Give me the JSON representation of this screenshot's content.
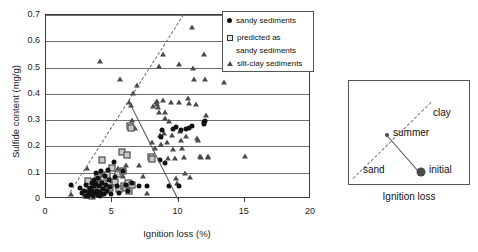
{
  "chart_data": {
    "type": "scatter",
    "title": "",
    "xlabel": "Ignition loss (%)",
    "ylabel": "Sulfide content (mg/g)",
    "xlim": [
      0,
      20
    ],
    "ylim": [
      0,
      0.7
    ],
    "xticks": [
      "0",
      "5",
      "10",
      "15",
      "20"
    ],
    "xtick_values": [
      0,
      5,
      10,
      15,
      20
    ],
    "yticks": [
      "0",
      "0.1",
      "0.2",
      "0.3",
      "0.4",
      "0.5",
      "0.6",
      "0.7"
    ],
    "ytick_values": [
      0,
      0.1,
      0.2,
      0.3,
      0.4,
      0.5,
      0.6,
      0.7
    ],
    "grid": "horizontal",
    "legend_position": "top-right",
    "legend": [
      {
        "marker": "filled-circle",
        "label": "sandy sediments"
      },
      {
        "marker": "open-square",
        "label": "predicted as"
      },
      {
        "marker": "none",
        "label": "sandy sediments"
      },
      {
        "marker": "filled-triangle",
        "label": "silt-clay sediments"
      }
    ],
    "annotations": [
      {
        "type": "dashed-trend-line",
        "x0": 1.8,
        "y0": 0.025,
        "x1": 10.35,
        "y1": 0.7
      },
      {
        "type": "solid-trend-line",
        "x0": 6.3,
        "y0": 0.372,
        "x1": 10.0,
        "y1": 0.0
      }
    ],
    "series": [
      {
        "name": "sandy sediments",
        "marker": "filled-circle",
        "points": [
          [
            1.85,
            0.052
          ],
          [
            2.6,
            0.042
          ],
          [
            2.75,
            0.022
          ],
          [
            2.9,
            0.03
          ],
          [
            3.0,
            0.013
          ],
          [
            3.05,
            0.055
          ],
          [
            3.15,
            0.028
          ],
          [
            3.2,
            0.01
          ],
          [
            3.3,
            0.042
          ],
          [
            3.35,
            0.018
          ],
          [
            3.45,
            0.062
          ],
          [
            3.5,
            0.032
          ],
          [
            3.55,
            0.012
          ],
          [
            3.6,
            0.072
          ],
          [
            3.65,
            0.048
          ],
          [
            3.7,
            0.022
          ],
          [
            3.75,
            0.098
          ],
          [
            3.8,
            0.058
          ],
          [
            3.85,
            0.03
          ],
          [
            3.9,
            0.014
          ],
          [
            3.95,
            0.08
          ],
          [
            4.0,
            0.05
          ],
          [
            4.05,
            0.025
          ],
          [
            4.1,
            0.01
          ],
          [
            4.15,
            0.105
          ],
          [
            4.2,
            0.062
          ],
          [
            4.3,
            0.038
          ],
          [
            4.35,
            0.018
          ],
          [
            4.45,
            0.088
          ],
          [
            4.5,
            0.055
          ],
          [
            4.6,
            0.03
          ],
          [
            4.7,
            0.112
          ],
          [
            4.75,
            0.072
          ],
          [
            4.85,
            0.045
          ],
          [
            4.9,
            0.018
          ],
          [
            5.1,
            0.14
          ],
          [
            5.2,
            0.085
          ],
          [
            5.35,
            0.048
          ],
          [
            5.5,
            0.022
          ],
          [
            5.8,
            0.105
          ],
          [
            6.0,
            0.055
          ],
          [
            6.2,
            0.03
          ],
          [
            6.5,
            0.062
          ],
          [
            7.0,
            0.05
          ],
          [
            7.6,
            0.048
          ],
          [
            8.6,
            0.15
          ],
          [
            8.7,
            0.235
          ],
          [
            8.75,
            0.262
          ],
          [
            9.0,
            0.138
          ],
          [
            9.3,
            0.05
          ],
          [
            9.6,
            0.265
          ],
          [
            9.8,
            0.275
          ],
          [
            10.0,
            0.048
          ],
          [
            10.2,
            0.262
          ],
          [
            10.6,
            0.268
          ],
          [
            10.8,
            0.272
          ],
          [
            11.0,
            0.278
          ],
          [
            11.9,
            0.285
          ],
          [
            11.95,
            0.292
          ],
          [
            12.0,
            0.298
          ]
        ]
      },
      {
        "name": "predicted as sandy sediments",
        "marker": "open-square",
        "points": [
          [
            3.0,
            0.015
          ],
          [
            3.2,
            0.07
          ],
          [
            3.3,
            0.035
          ],
          [
            3.5,
            0.012
          ],
          [
            3.6,
            0.052
          ],
          [
            3.8,
            0.025
          ],
          [
            3.9,
            0.085
          ],
          [
            4.0,
            0.042
          ],
          [
            4.1,
            0.018
          ],
          [
            4.2,
            0.148
          ],
          [
            4.3,
            0.062
          ],
          [
            4.4,
            0.03
          ],
          [
            4.6,
            0.09
          ],
          [
            4.8,
            0.042
          ],
          [
            5.0,
            0.118
          ],
          [
            5.2,
            0.065
          ],
          [
            5.4,
            0.095
          ],
          [
            5.5,
            0.038
          ],
          [
            5.7,
            0.178
          ],
          [
            5.8,
            0.105
          ],
          [
            5.9,
            0.048
          ],
          [
            6.0,
            0.04
          ],
          [
            6.1,
            0.168
          ],
          [
            6.2,
            0.062
          ],
          [
            6.3,
            0.03
          ],
          [
            6.35,
            0.278
          ],
          [
            6.4,
            0.272
          ],
          [
            6.5,
            0.055
          ],
          [
            7.9,
            0.158
          ],
          [
            8.0,
            0.152
          ]
        ]
      },
      {
        "name": "silt-clay sediments",
        "marker": "filled-triangle",
        "points": [
          [
            1.9,
            0.02
          ],
          [
            3.1,
            0.118
          ],
          [
            3.6,
            0.045
          ],
          [
            3.9,
            0.072
          ],
          [
            4.0,
            0.098
          ],
          [
            4.05,
            0.525
          ],
          [
            4.3,
            0.09
          ],
          [
            4.5,
            0.055
          ],
          [
            4.8,
            0.078
          ],
          [
            5.0,
            0.068
          ],
          [
            5.4,
            0.118
          ],
          [
            5.6,
            0.455
          ],
          [
            5.8,
            0.088
          ],
          [
            6.0,
            0.13
          ],
          [
            6.1,
            0.062
          ],
          [
            6.2,
            0.048
          ],
          [
            6.3,
            0.37
          ],
          [
            6.4,
            0.358
          ],
          [
            6.5,
            0.3
          ],
          [
            6.6,
            0.405
          ],
          [
            6.7,
            0.272
          ],
          [
            6.9,
            0.435
          ],
          [
            7.0,
            0.128
          ],
          [
            7.3,
            0.088
          ],
          [
            7.6,
            0.022
          ],
          [
            8.0,
            0.218
          ],
          [
            8.1,
            0.352
          ],
          [
            8.2,
            0.195
          ],
          [
            8.3,
            0.368
          ],
          [
            8.35,
            0.372
          ],
          [
            8.4,
            0.36
          ],
          [
            8.45,
            0.35
          ],
          [
            8.5,
            0.33
          ],
          [
            8.55,
            0.505
          ],
          [
            8.6,
            0.245
          ],
          [
            8.7,
            0.208
          ],
          [
            8.8,
            0.55
          ],
          [
            8.85,
            0.375
          ],
          [
            8.9,
            0.25
          ],
          [
            8.95,
            0.33
          ],
          [
            9.0,
            0.31
          ],
          [
            9.1,
            0.218
          ],
          [
            9.2,
            0.155
          ],
          [
            9.3,
            0.298
          ],
          [
            9.4,
            0.37
          ],
          [
            9.5,
            0.242
          ],
          [
            9.6,
            0.19
          ],
          [
            9.7,
            0.155
          ],
          [
            9.8,
            0.078
          ],
          [
            9.9,
            0.06
          ],
          [
            10.0,
            0.515
          ],
          [
            10.05,
            0.368
          ],
          [
            10.1,
            0.258
          ],
          [
            10.2,
            0.225
          ],
          [
            10.3,
            0.195
          ],
          [
            10.4,
            0.16
          ],
          [
            10.5,
            0.1
          ],
          [
            10.6,
            0.24
          ],
          [
            10.7,
            0.385
          ],
          [
            10.8,
            0.365
          ],
          [
            10.9,
            0.082
          ],
          [
            11.0,
            0.655
          ],
          [
            11.1,
            0.498
          ],
          [
            11.2,
            0.455
          ],
          [
            11.3,
            0.362
          ],
          [
            11.4,
            0.232
          ],
          [
            11.5,
            0.225
          ],
          [
            11.6,
            0.162
          ],
          [
            11.7,
            0.158
          ],
          [
            11.9,
            0.552
          ],
          [
            12.0,
            0.455
          ],
          [
            12.1,
            0.318
          ],
          [
            12.2,
            0.165
          ],
          [
            12.25,
            0.16
          ],
          [
            13.4,
            0.445
          ],
          [
            15.0,
            0.165
          ]
        ]
      }
    ]
  },
  "inset": {
    "ylabel": "Sulfide content",
    "xlabel": "Ignition loss",
    "labels": {
      "clay": "clay",
      "summer": "summer",
      "sand": "sand",
      "initial": "initial"
    },
    "dashed_line": {
      "x0": 4,
      "y0": 8,
      "x1": 82,
      "y1": 84
    },
    "solid_line": {
      "x0": 38,
      "y0": 54,
      "x1": 72,
      "y1": 12
    },
    "marker_dot": "filled-circle",
    "summer_dot": "small-filled-circle"
  },
  "colors": {
    "marker_dark": "#111111",
    "marker_square_fill": "#c9c9c9",
    "marker_triangle": "#4a4a4a",
    "grid": "#6f6f6f",
    "frame": "#3a3a3a",
    "background": "#ffffff"
  }
}
